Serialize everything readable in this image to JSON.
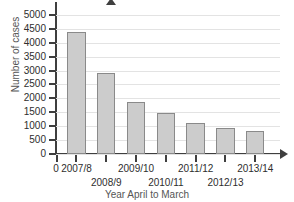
{
  "chart_data": {
    "type": "bar",
    "title": "",
    "xlabel": "Year April to March",
    "ylabel": "Number of cases",
    "categories": [
      "2007/8",
      "2008/9",
      "2009/10",
      "2010/11",
      "2011/12",
      "2012/13",
      "2013/14"
    ],
    "values": [
      4400,
      2900,
      1870,
      1480,
      1100,
      950,
      830
    ],
    "series": [
      {
        "name": "Number of cases",
        "values": [
          4400,
          2900,
          1870,
          1480,
          1100,
          950,
          830
        ]
      }
    ],
    "ylim": [
      0,
      5250
    ],
    "ytick_labels": [
      "0",
      "500",
      "1000",
      "1500",
      "2000",
      "2500",
      "3000",
      "3500",
      "4000",
      "4500",
      "5000"
    ],
    "ytick_values": [
      0,
      500,
      1000,
      1500,
      2000,
      2500,
      3000,
      3500,
      4000,
      4500,
      5000
    ],
    "origin_label": "0",
    "grid": "horizontal",
    "legend": "none",
    "bar_color": "#cccccc",
    "bar_border_color": "#8a8a8a",
    "axis_color": "#3f3f3f",
    "grid_color": "#e3e3e3",
    "background": "#ffffff",
    "x_label_rows": [
      [
        "2007/8",
        "2009/10",
        "2011/12",
        "2013/14"
      ],
      [
        "2008/9",
        "2010/11",
        "2012/13"
      ]
    ]
  }
}
